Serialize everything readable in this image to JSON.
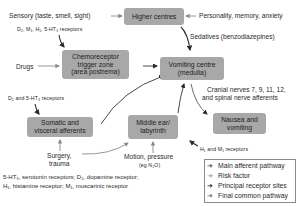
{
  "nodes": {
    "higher_centres": "Higher centres",
    "ctz_line1": "Chemoreceptor",
    "ctz_line2": "trigger zone",
    "ctz_line3": "(area postrema)",
    "vomiting_line1": "Vomiting centre",
    "vomiting_line2": "(medulla)",
    "somatic_line1": "Somatic and",
    "somatic_line2": "visceral afferents",
    "middle_ear_line1": "Middle ear/",
    "middle_ear_line2": "labyrinth",
    "nausea_line1": "Nausea and",
    "nausea_line2": "vomiting"
  },
  "labels": {
    "sensory": "Sensory (taste, smell, sight)",
    "personality": "Personality, memory, anxiety",
    "ctz_receptors": "D₂, M₁, H₁, 5-HT₃ receptors",
    "sedatives": "Sedatives (benzodiazepines)",
    "drugs": "Drugs",
    "somatic_receptors": "D₂ and 5-HT₃ receptors",
    "cranial_line1": "Cranial nerves 7, 9, 11, 12,",
    "cranial_line2": "and spinal nerve afferents",
    "surgery_line1": "Surgery,",
    "surgery_line2": "trauma",
    "motion_line1": "Motion, pressure",
    "motion_line2": "(eg N₂O)",
    "h1_m1": "H₁ and M₁ receptors"
  },
  "legend": {
    "items": [
      {
        "label": "Main afferent pathway",
        "color": "#4a4a4a"
      },
      {
        "label": "Risk factor",
        "color": "#9a9a9a"
      },
      {
        "label": "Principal receptor sites",
        "color": "#1a1a1a"
      },
      {
        "label": "Final common pathway",
        "color": "#6a6a6a"
      }
    ]
  },
  "footnote": {
    "line1": "5-HT₃, serotonin receptors; D₂, dopamine receptor;",
    "line2": "H₁, histamine receptor; M₁, muscarinic receptor"
  },
  "colors": {
    "box_fill": "#a8a8a8",
    "arrow_dark": "#2a2a2a",
    "arrow_light": "#9a9a9a"
  }
}
